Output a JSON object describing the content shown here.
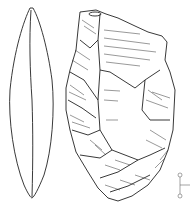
{
  "figure": {
    "views": [
      "side-profile",
      "dorsal-face"
    ],
    "scale_bar": {
      "orientation": "vertical",
      "markers": 2
    }
  },
  "colors": {
    "background": "#ffffff",
    "line": "#222222"
  }
}
